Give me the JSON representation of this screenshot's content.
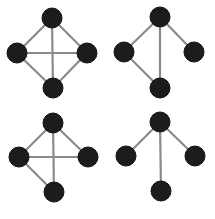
{
  "figure": {
    "description": "Four small undirected graphs on four vertices each, arranged in a 2x2 grid",
    "colors": {
      "node": "#1c1c1c",
      "edge": "#8a8a8a",
      "background": "#ffffff"
    },
    "node_radius": 10,
    "graphs": [
      {
        "id": "graph-1",
        "position": "top-left",
        "nodes": {
          "top": [
            52,
            18
          ],
          "left": [
            17,
            53
          ],
          "right": [
            87,
            53
          ],
          "bottom": [
            53,
            88
          ]
        },
        "edges": [
          [
            "top",
            "left"
          ],
          [
            "top",
            "right"
          ],
          [
            "top",
            "bottom"
          ],
          [
            "left",
            "right"
          ],
          [
            "left",
            "bottom"
          ],
          [
            "right",
            "bottom"
          ]
        ]
      },
      {
        "id": "graph-2",
        "position": "top-right",
        "nodes": {
          "top": [
            160,
            17
          ],
          "left": [
            124,
            52
          ],
          "right": [
            194,
            52
          ],
          "bottom": [
            160,
            88
          ]
        },
        "edges": [
          [
            "top",
            "left"
          ],
          [
            "top",
            "right"
          ],
          [
            "top",
            "bottom"
          ],
          [
            "left",
            "bottom"
          ]
        ]
      },
      {
        "id": "graph-3",
        "position": "bottom-left",
        "nodes": {
          "top": [
            53,
            123
          ],
          "left": [
            19,
            157
          ],
          "right": [
            88,
            157
          ],
          "bottom": [
            54,
            192
          ]
        },
        "edges": [
          [
            "top",
            "left"
          ],
          [
            "top",
            "right"
          ],
          [
            "top",
            "bottom"
          ],
          [
            "left",
            "right"
          ],
          [
            "left",
            "bottom"
          ]
        ]
      },
      {
        "id": "graph-4",
        "position": "bottom-right",
        "nodes": {
          "top": [
            160,
            122
          ],
          "left": [
            126,
            156
          ],
          "right": [
            195,
            156
          ],
          "bottom": [
            161,
            191
          ]
        },
        "edges": [
          [
            "top",
            "left"
          ],
          [
            "top",
            "right"
          ],
          [
            "top",
            "bottom"
          ]
        ]
      }
    ]
  }
}
